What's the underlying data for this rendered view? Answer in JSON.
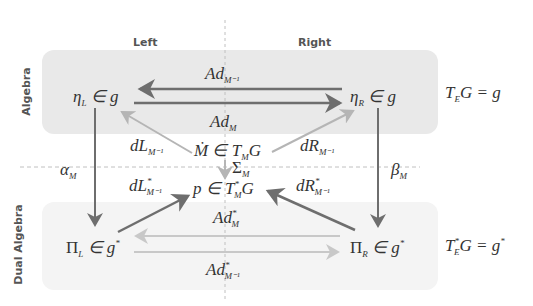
{
  "columns": {
    "left": "Left",
    "right": "Right"
  },
  "rows": {
    "top": "Algebra",
    "bottom": "Dual Algebra"
  },
  "nodes": {
    "eta_L": {
      "base": "η",
      "sub": "L",
      "rest": " ∈ g"
    },
    "eta_R": {
      "base": "η",
      "sub": "R",
      "rest": " ∈ g"
    },
    "Mdot": {
      "base": "Ṁ ∈ T",
      "sub": "M",
      "rest": "G"
    },
    "p": {
      "base": "p ∈ T",
      "sup": "*",
      "sub": "M",
      "rest": "G"
    },
    "Pi_L": {
      "base": "Π",
      "sub": "L",
      "rest": " ∈ g",
      "sup": "*"
    },
    "Pi_R": {
      "base": "Π",
      "sub": "R",
      "rest": " ∈ g",
      "sup": "*"
    },
    "TEG": {
      "base": "T",
      "sub": "E",
      "rest": "G = g"
    },
    "TEstarG": {
      "base": "T",
      "sup": "*",
      "sub": "E",
      "rest": "G = g",
      "sup2": "*"
    }
  },
  "arrows": {
    "Ad_Minv": {
      "base": "Ad",
      "sub": "M⁻¹"
    },
    "Ad_M": {
      "base": "Ad",
      "sub": "M"
    },
    "dL_Minv": {
      "base": "dL",
      "sub": "M⁻¹"
    },
    "dR_Minv": {
      "base": "dR",
      "sub": "M⁻¹"
    },
    "Sigma_M": {
      "base": "Σ",
      "sub": "M"
    },
    "alpha_M": {
      "base": "α",
      "sub": "M"
    },
    "beta_M": {
      "base": "β",
      "sub": "M"
    },
    "dLstar_Minv": {
      "base": "dL",
      "sup": "*",
      "sub": "M⁻¹"
    },
    "dRstar_Minv": {
      "base": "dR",
      "sup": "*",
      "sub": "M⁻¹"
    },
    "Adstar_M": {
      "base": "Ad",
      "sup": "*",
      "sub": "M"
    },
    "Adstar_Minv": {
      "base": "Ad",
      "sup": "*",
      "sub": "M⁻¹"
    }
  },
  "colors": {
    "dark_arrow": "#6e6e6e",
    "light_arrow": "#b5b5b5",
    "lighter_arrow": "#c8c8c8",
    "top_box": "#e9e9e9",
    "bottom_box": "#f4f4f4",
    "dash": "#c0c0c0"
  }
}
